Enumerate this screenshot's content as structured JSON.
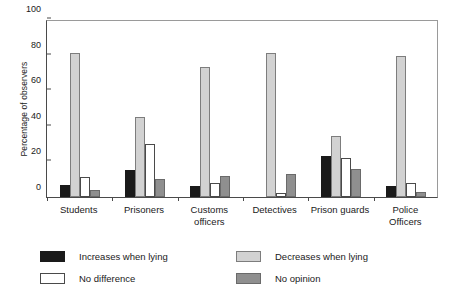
{
  "chart_data": {
    "type": "bar",
    "title": "",
    "xlabel": "",
    "ylabel": "Percentage of observers",
    "ylim": [
      0,
      100
    ],
    "yticks": [
      0,
      20,
      40,
      60,
      80,
      100
    ],
    "grid": false,
    "legend_position": "below-chart",
    "categories": [
      "Students",
      "Prisoners",
      "Customs\nofficers",
      "Detectives",
      "Prison guards",
      "Police\nOfficers"
    ],
    "series": [
      {
        "name": "Increases when lying",
        "color": "#1a1a1a",
        "values": [
          7,
          15,
          6,
          0,
          23,
          6
        ]
      },
      {
        "name": "Decreases when lying",
        "color": "#d2d2d2",
        "values": [
          81,
          45,
          73,
          81,
          34,
          79
        ]
      },
      {
        "name": "No difference",
        "color": "#ffffff",
        "values": [
          11,
          30,
          8,
          2,
          22,
          8
        ]
      },
      {
        "name": "No opinion",
        "color": "#8f8f8f",
        "values": [
          4,
          10,
          12,
          13,
          16,
          3
        ]
      }
    ]
  }
}
